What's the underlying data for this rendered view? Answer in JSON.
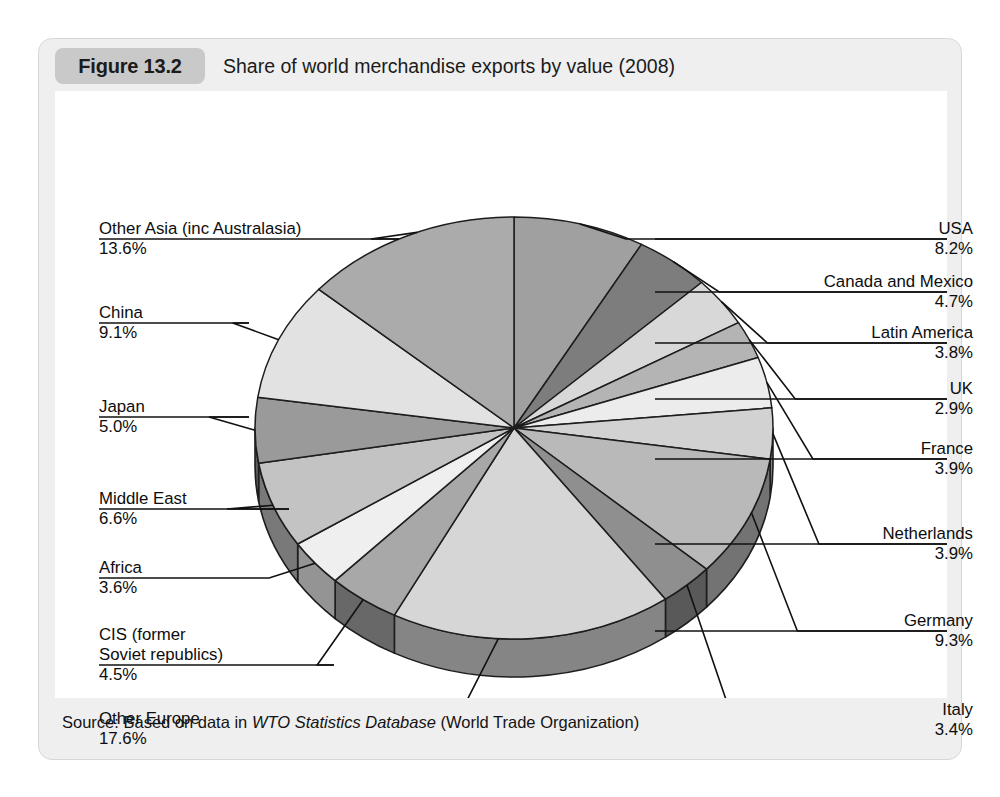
{
  "figure": {
    "badge": "Figure 13.2",
    "title": "Share of world merchandise exports by value (2008)",
    "source_prefix": "Source: Based on data in ",
    "source_italic": "WTO Statistics Database",
    "source_suffix": " (World Trade Organization)"
  },
  "chart_data": {
    "type": "pie",
    "title": "Share of world merchandise exports by value (2008)",
    "unit": "%",
    "start_angle_deg": 0,
    "direction": "clockwise",
    "three_d": true,
    "legend": "callout-labels",
    "categories": [
      "USA",
      "Canada and Mexico",
      "Latin America",
      "UK",
      "France",
      "Netherlands",
      "Germany",
      "Italy",
      "Other Europe",
      "CIS (former Soviet republics)",
      "Africa",
      "Middle East",
      "Japan",
      "China",
      "Other Asia (inc Australasia)"
    ],
    "values": [
      8.2,
      4.7,
      3.8,
      2.9,
      3.9,
      3.9,
      9.3,
      3.4,
      17.6,
      4.5,
      3.6,
      6.6,
      5.0,
      9.1,
      13.6
    ],
    "colors": [
      "#a0a0a0",
      "#7d7d7d",
      "#d8d8d8",
      "#b4b4b4",
      "#ececec",
      "#d2d2d2",
      "#b9b9b9",
      "#8f8f8f",
      "#d6d6d6",
      "#a8a8a8",
      "#efefef",
      "#c3c3c3",
      "#9a9a9a",
      "#e2e2e2",
      "#ababab"
    ]
  },
  "labels": {
    "right": [
      {
        "name": "USA",
        "pct": "8.2%"
      },
      {
        "name": "Canada and Mexico",
        "pct": "4.7%"
      },
      {
        "name": "Latin America",
        "pct": "3.8%"
      },
      {
        "name": "UK",
        "pct": "2.9%"
      },
      {
        "name": "France",
        "pct": "3.9%"
      },
      {
        "name": "Netherlands",
        "pct": "3.9%"
      },
      {
        "name": "Germany",
        "pct": "9.3%"
      },
      {
        "name": "Italy",
        "pct": "3.4%"
      }
    ],
    "left": [
      {
        "name": "Other Asia (inc Australasia)",
        "pct": "13.6%"
      },
      {
        "name": "China",
        "pct": "9.1%"
      },
      {
        "name": "Japan",
        "pct": "5.0%"
      },
      {
        "name": "Middle East",
        "pct": "6.6%"
      },
      {
        "name": "Africa",
        "pct": "3.6%"
      },
      {
        "name": "CIS (former",
        "name2": "Soviet republics)",
        "pct": "4.5%"
      },
      {
        "name": "Other Europe",
        "pct": "17.6%"
      }
    ]
  }
}
